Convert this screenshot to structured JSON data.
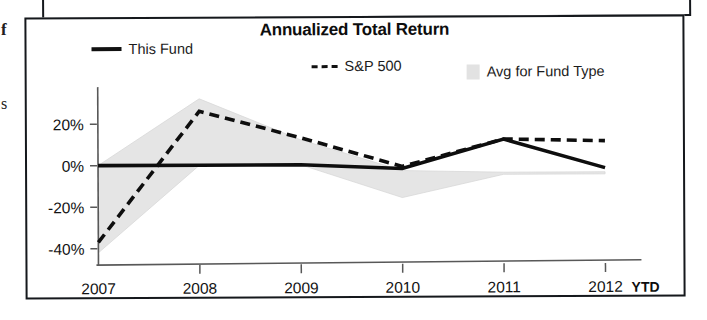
{
  "page": {
    "edge_fragments": [
      "f",
      "s"
    ]
  },
  "chart": {
    "title": "Annualized Total Return",
    "legend": [
      {
        "key": "this_fund",
        "label": "This Fund",
        "marker": "solid-line-marker"
      },
      {
        "key": "sp500",
        "label": "S&P 500",
        "marker": "dashed-line-marker"
      },
      {
        "key": "avg_fund_type",
        "label": "Avg for Fund Type",
        "marker": "gray-band-swatch"
      }
    ],
    "x_suffix_label": "YTD"
  },
  "chart_data": {
    "type": "line",
    "title": "Annualized Total Return",
    "xlabel": "",
    "ylabel": "",
    "grid": false,
    "legend_position": "top",
    "categories": [
      "2007",
      "2008",
      "2009",
      "2010",
      "2011",
      "2012"
    ],
    "x_axis_note": "2012 YTD",
    "ylim": [
      -46,
      34
    ],
    "yticks": [
      20,
      0,
      -20,
      -40
    ],
    "ytick_labels": [
      "20%",
      "0%",
      "-20%",
      "-40%"
    ],
    "series": [
      {
        "name": "This Fund",
        "style": "solid",
        "color": "#0e0e0e",
        "values": [
          0,
          0,
          0,
          -2,
          12,
          -2
        ]
      },
      {
        "name": "S&P 500",
        "style": "dashed",
        "color": "#0e0e0e",
        "values": [
          -37,
          26,
          13,
          -1,
          12,
          11
        ]
      },
      {
        "name": "Avg for Fund Type",
        "style": "band",
        "color": "#dcdcdc",
        "band_upper": [
          0,
          32,
          12,
          -3,
          -4,
          -4
        ],
        "band_lower": [
          -42,
          0,
          0,
          -16,
          -5,
          -5
        ]
      }
    ]
  }
}
